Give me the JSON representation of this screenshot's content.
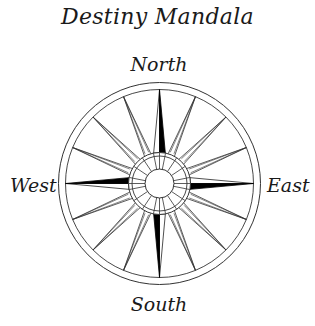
{
  "title": "Destiny Mandala",
  "directions": {
    "north": "North",
    "south": "South",
    "east": "East",
    "west": "West"
  },
  "compass": {
    "points": 16,
    "cardinal_fill": "#000000",
    "stroke": "#333333"
  }
}
